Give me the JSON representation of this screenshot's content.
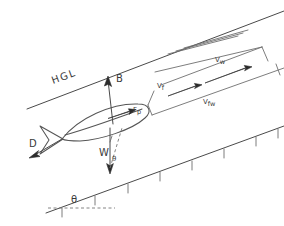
{
  "figure": {
    "background_color": "#ffffff",
    "ink_color": "#4a4a4a"
  },
  "labels": {
    "hgl": "HGL",
    "buoyancy": "B",
    "propulsion": "Fp",
    "propulsion_main": "F",
    "propulsion_sub": "p",
    "weight": "W",
    "drag": "D",
    "angle_body": "θ",
    "angle_slope": "θ",
    "velocity_fish": "Vf",
    "velocity_fish_main": "V",
    "velocity_fish_sub": "f",
    "velocity_water": "Vw",
    "velocity_water_main": "V",
    "velocity_water_sub": "w",
    "velocity_fish_water": "Vfw",
    "velocity_fish_water_main": "V",
    "velocity_fish_water_sub": "fw"
  },
  "elements": {
    "hgl_line": "hydraulic-grade-line",
    "bed_line": "channel-bed-line",
    "bed_hatching": "bed-hatch-ticks",
    "free_surface_streaks": "water-surface-streak-lines",
    "fish_body": "fish-body-outline",
    "fish_tail": "fish-tail-fin",
    "horizontal_reference": "dashed-horizontal-datum",
    "vw_bracket": "velocity-water-dimension-bracket",
    "vf_bracket": "velocity-fish-dimension-bracket",
    "vfw_bracket": "velocity-fish-water-dimension-bracket"
  },
  "vectors": [
    {
      "name": "B",
      "meaning": "buoyancy-force",
      "direction": "up"
    },
    {
      "name": "Fp",
      "meaning": "propulsive-force",
      "direction": "up-slope"
    },
    {
      "name": "W",
      "meaning": "weight-force",
      "direction": "down"
    },
    {
      "name": "D",
      "meaning": "drag-force",
      "direction": "down-slope"
    },
    {
      "name": "Vf",
      "meaning": "fish-velocity",
      "direction": "up-slope"
    },
    {
      "name": "Vw",
      "meaning": "water-velocity",
      "direction": "up-slope"
    },
    {
      "name": "Vfw",
      "meaning": "relative-fish-water-velocity",
      "direction": "up-slope"
    }
  ]
}
